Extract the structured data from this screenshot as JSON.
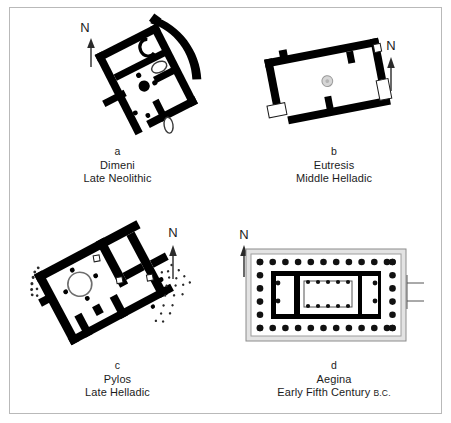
{
  "plate": {
    "title": "Greek House and Temple Plans",
    "background_color": "#ffffff",
    "frame_color": "#b9b9b9"
  },
  "panels": [
    {
      "letter": "a",
      "site": "Dimeni",
      "period": "Late Neolithic",
      "period_suffix": "",
      "north_label": "N",
      "plan_type": "neolithic-house-with-curved-enclosure",
      "features": [
        "curved outer wall",
        "interior cross walls",
        "central hearth",
        "postholes",
        "C-shaped feature",
        "oval feature"
      ],
      "rotation_deg": -28
    },
    {
      "letter": "b",
      "site": "Eutresis",
      "period": "Middle Helladic",
      "period_suffix": "",
      "north_label": "N",
      "plan_type": "rectangular-long-house",
      "features": [
        "thick rubble walls",
        "central circular hearth",
        "wall stubs",
        "open corner segments"
      ],
      "rotation_deg": -12
    },
    {
      "letter": "c",
      "site": "Pylos",
      "period": "Late Helladic",
      "period_suffix": "",
      "north_label": "N",
      "plan_type": "mycenaean-megaron",
      "features": [
        "circular central hearth",
        "four columns around hearth",
        "vestibule",
        "porch",
        "column bases",
        "rubble stipple"
      ],
      "rotation_deg": -28
    },
    {
      "letter": "d",
      "site": "Aegina",
      "period": "Early Fifth Century ",
      "period_suffix": "B.C.",
      "north_label": "N",
      "plan_type": "doric-peripteral-temple",
      "features": [
        "stylobate platform",
        "peristyle colonnade",
        "naos with two interior colonnades",
        "pronaos",
        "opisthodomos"
      ],
      "rotation_deg": 0,
      "colonnade": {
        "flank_columns": 12,
        "end_columns": 6,
        "interior_rows": 2,
        "interior_columns_per_row": 5
      }
    }
  ],
  "colors": {
    "wall": "#000000",
    "hearth_ring": "#6e6e6e",
    "hearth_fill": "#d6d6d6",
    "stylobate": "#e3e3e3",
    "column": "#111111",
    "text": "#1b1b1b"
  }
}
